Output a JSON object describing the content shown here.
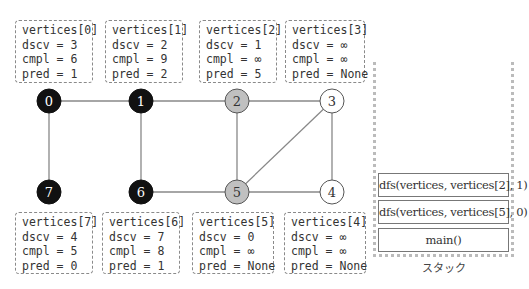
{
  "vertices_top": [
    {
      "title": "vertices[0]",
      "dscv": "dscv = 3",
      "cmpl": "cmpl = 6",
      "pred": "pred = 1"
    },
    {
      "title": "vertices[1]",
      "dscv": "dscv = 2",
      "cmpl": "cmpl = 9",
      "pred": "pred = 2"
    },
    {
      "title": "vertices[2]",
      "dscv": "dscv = 1",
      "cmpl": "cmpl = ∞",
      "pred": "pred = 5"
    },
    {
      "title": "vertices[3]",
      "dscv": "dscv = ∞",
      "cmpl": "cmpl = ∞",
      "pred": "pred = None"
    }
  ],
  "vertices_bottom": [
    {
      "title": "vertices[7]",
      "dscv": "dscv = 4",
      "cmpl": "cmpl = 5",
      "pred": "pred = 0"
    },
    {
      "title": "vertices[6]",
      "dscv": "dscv = 7",
      "cmpl": "cmpl = 8",
      "pred": "pred = 1"
    },
    {
      "title": "vertices[5]",
      "dscv": "dscv = 0",
      "cmpl": "cmpl = ∞",
      "pred": "pred = None"
    },
    {
      "title": "vertices[4]",
      "dscv": "dscv = ∞",
      "cmpl": "cmpl = ∞",
      "pred": "pred = None"
    }
  ],
  "graph": {
    "nodes": [
      {
        "id": "0",
        "state": "completed"
      },
      {
        "id": "1",
        "state": "completed"
      },
      {
        "id": "2",
        "state": "discovered"
      },
      {
        "id": "3",
        "state": "undiscovered"
      },
      {
        "id": "4",
        "state": "undiscovered"
      },
      {
        "id": "5",
        "state": "discovered"
      },
      {
        "id": "6",
        "state": "completed"
      },
      {
        "id": "7",
        "state": "completed"
      }
    ],
    "edges": [
      [
        "0",
        "1"
      ],
      [
        "1",
        "2"
      ],
      [
        "2",
        "3"
      ],
      [
        "0",
        "7"
      ],
      [
        "1",
        "6"
      ],
      [
        "2",
        "5"
      ],
      [
        "3",
        "5"
      ],
      [
        "3",
        "4"
      ],
      [
        "6",
        "5"
      ],
      [
        "5",
        "4"
      ]
    ],
    "colors": {
      "completed": "#111111",
      "discovered": "#c0c0c0",
      "undiscovered": "#ffffff",
      "edge": "#888888"
    }
  },
  "stack": {
    "items": [
      "dfs(vertices, vertices[2], 1)",
      "dfs(vertices, vertices[5], 0)",
      "main()"
    ],
    "label": "スタック"
  }
}
